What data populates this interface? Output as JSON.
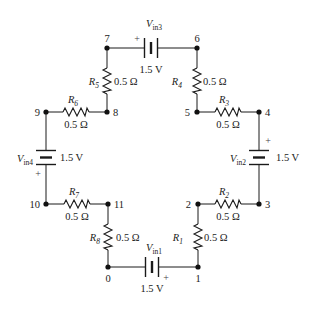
{
  "diagram": {
    "type": "circuit",
    "nodes": [
      {
        "id": "0",
        "label": "0"
      },
      {
        "id": "1",
        "label": "1"
      },
      {
        "id": "2",
        "label": "2"
      },
      {
        "id": "3",
        "label": "3"
      },
      {
        "id": "4",
        "label": "4"
      },
      {
        "id": "5",
        "label": "5"
      },
      {
        "id": "6",
        "label": "6"
      },
      {
        "id": "7",
        "label": "7"
      },
      {
        "id": "8",
        "label": "8"
      },
      {
        "id": "9",
        "label": "9"
      },
      {
        "id": "10",
        "label": "10"
      },
      {
        "id": "11",
        "label": "11"
      }
    ],
    "resistors": [
      {
        "name": "R",
        "sub": "1",
        "value": "0.5 Ω",
        "from": "1",
        "to": "2"
      },
      {
        "name": "R",
        "sub": "2",
        "value": "0.5 Ω",
        "from": "2",
        "to": "3"
      },
      {
        "name": "R",
        "sub": "3",
        "value": "0.5 Ω",
        "from": "5",
        "to": "4"
      },
      {
        "name": "R",
        "sub": "4",
        "value": "0.5 Ω",
        "from": "6",
        "to": "5"
      },
      {
        "name": "R",
        "sub": "5",
        "value": "0.5 Ω",
        "from": "7",
        "to": "8"
      },
      {
        "name": "R",
        "sub": "6",
        "value": "0.5 Ω",
        "from": "9",
        "to": "8"
      },
      {
        "name": "R",
        "sub": "7",
        "value": "0.5 Ω",
        "from": "10",
        "to": "11"
      },
      {
        "name": "R",
        "sub": "8",
        "value": "0.5 Ω",
        "from": "11",
        "to": "0"
      }
    ],
    "sources": [
      {
        "name": "V",
        "sub": "in1",
        "value": "1.5 V",
        "from": "0",
        "to": "1",
        "plus": "+"
      },
      {
        "name": "V",
        "sub": "in2",
        "value": "1.5 V",
        "from": "3",
        "to": "4",
        "plus": "+"
      },
      {
        "name": "V",
        "sub": "in3",
        "value": "1.5 V",
        "from": "7",
        "to": "6",
        "plus": "+"
      },
      {
        "name": "V",
        "sub": "in4",
        "value": "1.5 V",
        "from": "9",
        "to": "10",
        "plus": "+"
      }
    ]
  }
}
